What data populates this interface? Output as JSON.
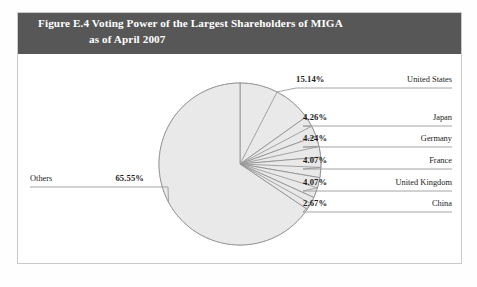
{
  "figure": {
    "number": "Figure E.4",
    "title_line1": "Figure E.4  Voting Power of the Largest Shareholders of MIGA",
    "title_line2": "as of April 2007"
  },
  "colors": {
    "header_background": "#575757",
    "header_text": "#ffffff",
    "slice_fill": "#e9e9e9",
    "slice_stroke": "#8c8c8c",
    "frame_border": "#c9c9c9",
    "leader_line": "#9a9a9a",
    "label_text": "#1b1b1b"
  },
  "chart_data": {
    "type": "pie",
    "title": "Voting Power of the Largest Shareholders of MIGA as of April 2007",
    "subtitle": "",
    "xlabel": "",
    "ylabel": "",
    "unit": "percent",
    "start_angle_deg": 0,
    "direction": "clockwise",
    "legend_position": "callout-labels",
    "grid": false,
    "categories": [
      "United States",
      "Japan",
      "Germany",
      "France",
      "United Kingdom",
      "China",
      "Others"
    ],
    "values": [
      15.14,
      4.26,
      4.24,
      4.07,
      4.07,
      2.67,
      65.55
    ],
    "labels": [
      "15.14%",
      "4.26%",
      "4.24%",
      "4.07%",
      "4.07%",
      "2.67%",
      "65.55%"
    ],
    "slices": [
      {
        "name": "United States",
        "value": 15.14,
        "label": "15.14%",
        "side": "right"
      },
      {
        "name": "Japan",
        "value": 4.26,
        "label": "4.26%",
        "side": "right"
      },
      {
        "name": "Germany",
        "value": 4.24,
        "label": "4.24%",
        "side": "right"
      },
      {
        "name": "France",
        "value": 4.07,
        "label": "4.07%",
        "side": "right"
      },
      {
        "name": "United Kingdom",
        "value": 4.07,
        "label": "4.07%",
        "side": "right"
      },
      {
        "name": "China",
        "value": 2.67,
        "label": "2.67%",
        "side": "right"
      },
      {
        "name": "Others",
        "value": 65.55,
        "label": "65.55%",
        "side": "left"
      }
    ]
  }
}
